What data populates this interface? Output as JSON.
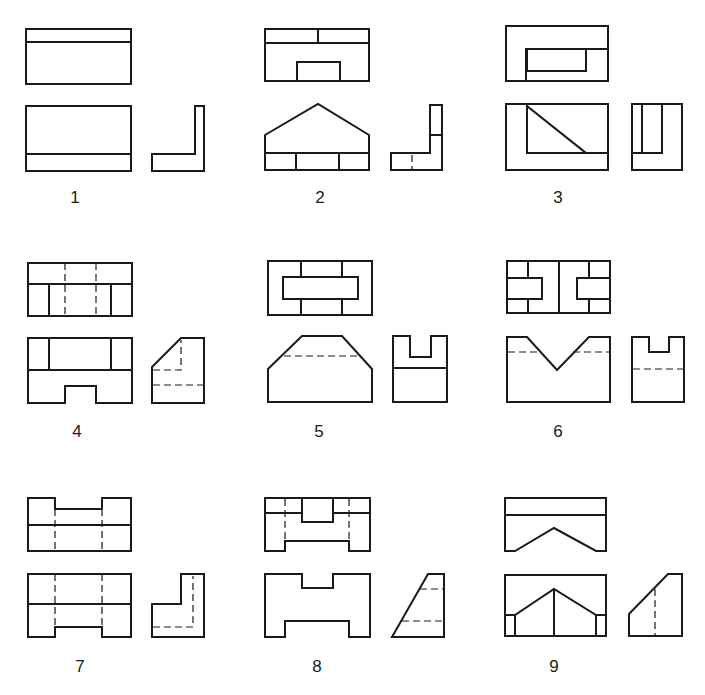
{
  "sheet": {
    "title": "Orthographic projection exercises",
    "stroke_color": "#1a1a1a",
    "background": "#ffffff"
  },
  "figures": [
    {
      "number": "1"
    },
    {
      "number": "2"
    },
    {
      "number": "3"
    },
    {
      "number": "4"
    },
    {
      "number": "5"
    },
    {
      "number": "6"
    },
    {
      "number": "7"
    },
    {
      "number": "8"
    },
    {
      "number": "9"
    }
  ],
  "caption": {
    "text": ""
  }
}
